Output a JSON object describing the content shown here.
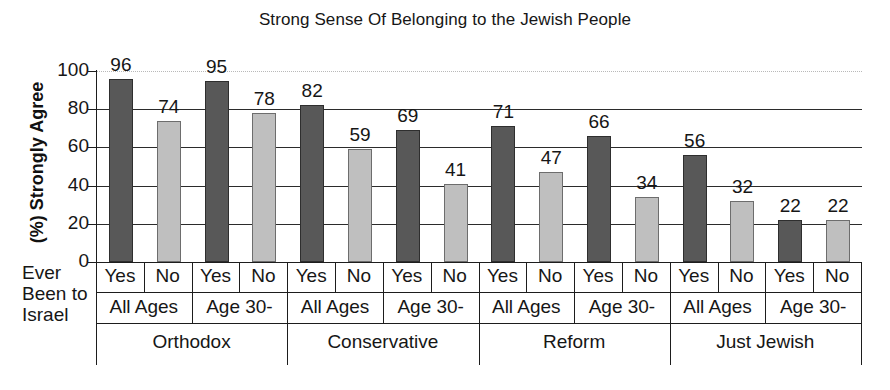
{
  "chart_data": {
    "type": "bar",
    "title": "Strong Sense Of Belonging to the Jewish People",
    "xlabel": "",
    "ylabel": "(%) Strongly Agree",
    "ylim": [
      0,
      100
    ],
    "yticks": [
      0,
      20,
      40,
      60,
      80,
      100
    ],
    "grid": true,
    "legend": "none",
    "row_header": [
      "Ever",
      "Been to",
      "Israel"
    ],
    "groups": [
      {
        "denomination": "Orthodox",
        "subgroups": [
          {
            "age": "All Ages",
            "bars": [
              {
                "category": "Yes",
                "value": 96,
                "color": "#585858"
              },
              {
                "category": "No",
                "value": 74,
                "color": "#bfbfbf"
              }
            ]
          },
          {
            "age": "Age 30-",
            "bars": [
              {
                "category": "Yes",
                "value": 95,
                "color": "#585858"
              },
              {
                "category": "No",
                "value": 78,
                "color": "#bfbfbf"
              }
            ]
          }
        ]
      },
      {
        "denomination": "Conservative",
        "subgroups": [
          {
            "age": "All Ages",
            "bars": [
              {
                "category": "Yes",
                "value": 82,
                "color": "#585858"
              },
              {
                "category": "No",
                "value": 59,
                "color": "#bfbfbf"
              }
            ]
          },
          {
            "age": "Age 30-",
            "bars": [
              {
                "category": "Yes",
                "value": 69,
                "color": "#585858"
              },
              {
                "category": "No",
                "value": 41,
                "color": "#bfbfbf"
              }
            ]
          }
        ]
      },
      {
        "denomination": "Reform",
        "subgroups": [
          {
            "age": "All Ages",
            "bars": [
              {
                "category": "Yes",
                "value": 71,
                "color": "#585858"
              },
              {
                "category": "No",
                "value": 47,
                "color": "#bfbfbf"
              }
            ]
          },
          {
            "age": "Age 30-",
            "bars": [
              {
                "category": "Yes",
                "value": 66,
                "color": "#585858"
              },
              {
                "category": "No",
                "value": 34,
                "color": "#bfbfbf"
              }
            ]
          }
        ]
      },
      {
        "denomination": "Just Jewish",
        "subgroups": [
          {
            "age": "All Ages",
            "bars": [
              {
                "category": "Yes",
                "value": 56,
                "color": "#585858"
              },
              {
                "category": "No",
                "value": 32,
                "color": "#bfbfbf"
              }
            ]
          },
          {
            "age": "Age 30-",
            "bars": [
              {
                "category": "Yes",
                "value": 22,
                "color": "#585858"
              },
              {
                "category": "No",
                "value": 22,
                "color": "#bfbfbf"
              }
            ]
          }
        ]
      }
    ],
    "categories": [
      "Orthodox / All Ages / Yes",
      "Orthodox / All Ages / No",
      "Orthodox / Age 30- / Yes",
      "Orthodox / Age 30- / No",
      "Conservative / All Ages / Yes",
      "Conservative / All Ages / No",
      "Conservative / Age 30- / Yes",
      "Conservative / Age 30- / No",
      "Reform / All Ages / Yes",
      "Reform / All Ages / No",
      "Reform / Age 30- / Yes",
      "Reform / Age 30- / No",
      "Just Jewish / All Ages / Yes",
      "Just Jewish / All Ages / No",
      "Just Jewish / Age 30- / Yes",
      "Just Jewish / Age 30- / No"
    ],
    "values": [
      96,
      74,
      95,
      78,
      82,
      59,
      69,
      41,
      71,
      47,
      66,
      34,
      56,
      32,
      22,
      22
    ],
    "colors": {
      "yes_bar": "#585858",
      "no_bar": "#bfbfbf",
      "axis": "#1d1d1d"
    }
  }
}
